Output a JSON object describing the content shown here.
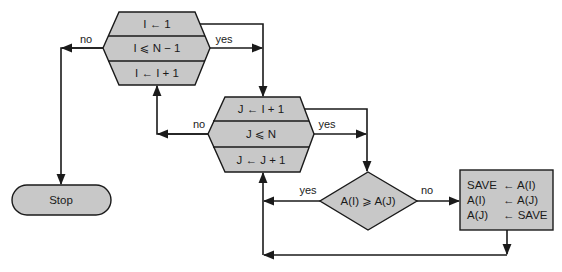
{
  "diagram": {
    "colors": {
      "fill": "#c8c8c8",
      "stroke": "#1a1a1a",
      "background": "#ffffff"
    },
    "outer_loop": {
      "init": "I ← 1",
      "test": "I ⩽ N − 1",
      "increment": "I ← I + 1",
      "yes_label": "yes",
      "no_label": "no"
    },
    "inner_loop": {
      "init": "J ← I + 1",
      "test": "J ⩽ N",
      "increment": "J ← J + 1",
      "yes_label": "yes",
      "no_label": "no"
    },
    "decision": {
      "text": "A(I) ⩾ A(J)",
      "yes_label": "yes",
      "no_label": "no"
    },
    "swap_box": {
      "lines": [
        {
          "left": "SAVE",
          "right": "← A(I)"
        },
        {
          "left": "A(I)",
          "right": "← A(J)"
        },
        {
          "left": "A(J)",
          "right": "← SAVE"
        }
      ]
    },
    "terminal": {
      "text": "Stop"
    }
  }
}
